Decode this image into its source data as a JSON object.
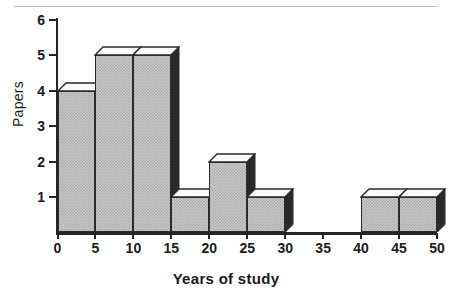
{
  "figure": {
    "background": "#ffffff",
    "rule_color": "#b9b9b9"
  },
  "axes": {
    "y_title": "Papers",
    "x_title": "Years of study",
    "y_ticks": [
      "1",
      "2",
      "3",
      "4",
      "5",
      "6"
    ],
    "x_ticks": [
      "0",
      "5",
      "10",
      "15",
      "20",
      "25",
      "30",
      "35",
      "40",
      "45",
      "50"
    ]
  },
  "chart_data": {
    "type": "bar",
    "title": "",
    "subtitle": "",
    "xlabel": "Years of study",
    "ylabel": "Papers",
    "xlim": [
      0,
      50
    ],
    "ylim": [
      0,
      6
    ],
    "grid": false,
    "legend": null,
    "style": "3d-histogram-hatched",
    "bin_width": 5,
    "categories": [
      "0-5",
      "5-10",
      "10-15",
      "15-20",
      "20-25",
      "25-30",
      "30-35",
      "35-40",
      "40-45",
      "45-50"
    ],
    "bin_edges": [
      0,
      5,
      10,
      15,
      20,
      25,
      30,
      35,
      40,
      45,
      50
    ],
    "values": [
      4,
      5,
      5,
      1,
      2,
      1,
      0,
      0,
      1,
      1
    ],
    "x_tick_values": [
      0,
      5,
      10,
      15,
      20,
      25,
      30,
      35,
      40,
      45,
      50
    ],
    "y_tick_values": [
      1,
      2,
      3,
      4,
      5,
      6
    ],
    "colors": {
      "bar_face": "#c9c9c9",
      "bar_hatch": "#a8a8a8",
      "bar_top": "#fbfbfb",
      "bar_side": "#2a2a2a",
      "outline": "#2b2b2b",
      "axis": "#262626"
    }
  }
}
